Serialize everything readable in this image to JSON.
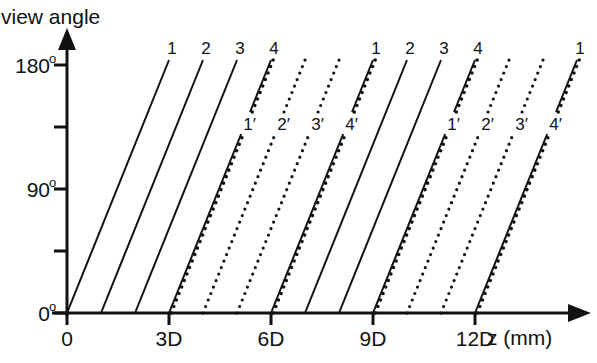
{
  "diagram": {
    "ylabel": "view angle",
    "xlabel": "z (mm)",
    "y_ticks": [
      {
        "label": "180",
        "sup": "o",
        "value": 180
      },
      {
        "label": "",
        "sup": "",
        "value": 135
      },
      {
        "label": "90",
        "sup": "o",
        "value": 90
      },
      {
        "label": "",
        "sup": "",
        "value": 45
      },
      {
        "label": "0",
        "sup": "o",
        "value": 0
      }
    ],
    "x_ticks": [
      {
        "label": "0",
        "d": 0
      },
      {
        "label": "3D",
        "d": 3
      },
      {
        "label": "6D",
        "d": 6
      },
      {
        "label": "9D",
        "d": 9
      },
      {
        "label": "12D",
        "d": 12
      }
    ],
    "top_labels": [
      {
        "text": "1",
        "d": 3
      },
      {
        "text": "2",
        "d": 4
      },
      {
        "text": "3",
        "d": 5
      },
      {
        "text": "4",
        "d": 6
      },
      {
        "text": "1",
        "d": 9
      },
      {
        "text": "2",
        "d": 10
      },
      {
        "text": "3",
        "d": 11
      },
      {
        "text": "4",
        "d": 12
      },
      {
        "text": "1",
        "d": 15
      }
    ],
    "primed_labels": [
      {
        "text": "1′",
        "d": 3
      },
      {
        "text": "2′",
        "d": 4
      },
      {
        "text": "3′",
        "d": 5
      },
      {
        "text": "4′",
        "d": 6
      },
      {
        "text": "1′",
        "d": 9
      },
      {
        "text": "2′",
        "d": 10
      },
      {
        "text": "3′",
        "d": 11
      },
      {
        "text": "4′",
        "d": 12
      }
    ],
    "lines": [
      {
        "base_d": 0,
        "style": "solid"
      },
      {
        "base_d": 1,
        "style": "solid"
      },
      {
        "base_d": 2,
        "style": "solid"
      },
      {
        "base_d": 3,
        "style": "thick"
      },
      {
        "base_d": 4,
        "style": "dotted"
      },
      {
        "base_d": 5,
        "style": "dotted"
      },
      {
        "base_d": 6,
        "style": "thick"
      },
      {
        "base_d": 7,
        "style": "solid"
      },
      {
        "base_d": 8,
        "style": "solid"
      },
      {
        "base_d": 9,
        "style": "thick"
      },
      {
        "base_d": 10,
        "style": "dotted"
      },
      {
        "base_d": 11,
        "style": "dotted"
      },
      {
        "base_d": 12,
        "style": "thick"
      }
    ],
    "colors": {
      "ink": "#111111",
      "background": "#ffffff"
    }
  }
}
